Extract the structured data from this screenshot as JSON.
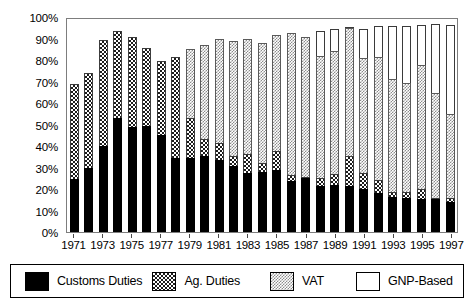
{
  "chart_data": {
    "type": "bar",
    "stacked": true,
    "title": "",
    "xlabel": "",
    "ylabel": "",
    "ylim": [
      0,
      100
    ],
    "ytick_labels": [
      "100%",
      "90%",
      "80%",
      "70%",
      "60%",
      "50%",
      "40%",
      "30%",
      "20%",
      "10%",
      "0%"
    ],
    "ytick_values": [
      100,
      90,
      80,
      70,
      60,
      50,
      40,
      30,
      20,
      10,
      0
    ],
    "grid": false,
    "legend_position": "bottom",
    "categories": [
      1971,
      1972,
      1973,
      1974,
      1975,
      1976,
      1977,
      1978,
      1979,
      1980,
      1981,
      1982,
      1983,
      1984,
      1985,
      1986,
      1987,
      1988,
      1989,
      1990,
      1991,
      1992,
      1993,
      1994,
      1995,
      1996,
      1997
    ],
    "xtick_labels": [
      "1971",
      "",
      "1973",
      "",
      "1975",
      "",
      "1977",
      "",
      "1979",
      "",
      "1981",
      "",
      "1983",
      "",
      "1985",
      "",
      "1987",
      "",
      "1989",
      "",
      "1991",
      "",
      "1993",
      "",
      "1995",
      "",
      "1997"
    ],
    "series": [
      {
        "name": "Customs Duties",
        "color": "#000000",
        "pattern": "solid-black",
        "values": [
          24.5,
          30.0,
          40.0,
          53.0,
          49.0,
          49.5,
          45.0,
          34.5,
          34.5,
          35.5,
          33.5,
          30.5,
          27.5,
          28.0,
          29.0,
          23.5,
          25.0,
          21.5,
          22.0,
          21.5,
          20.0,
          18.0,
          16.5,
          16.0,
          15.5,
          15.5,
          14.0
        ]
      },
      {
        "name": "Ag. Duties",
        "color": "#1c1c1c",
        "pattern": "coarse-checker",
        "values": [
          69.0,
          74.0,
          89.5,
          93.5,
          90.5,
          85.5,
          79.5,
          81.5,
          53.0,
          43.5,
          41.5,
          35.5,
          36.5,
          32.0,
          37.5,
          26.5,
          25.5,
          25.0,
          27.0,
          35.5,
          27.5,
          24.0,
          18.5,
          18.5,
          20.0,
          15.5,
          16.0
        ]
      },
      {
        "name": "VAT",
        "color": "#8c8c8c",
        "pattern": "fine-checker",
        "values": [
          0,
          0,
          0,
          0,
          0,
          0,
          0,
          0,
          85.0,
          87.0,
          90.0,
          89.0,
          90.0,
          88.0,
          91.5,
          92.5,
          90.5,
          82.0,
          84.0,
          95.0,
          81.0,
          81.5,
          71.0,
          69.5,
          77.5,
          64.0,
          55.0
        ]
      },
      {
        "name": "GNP-Based",
        "color": "#ffffff",
        "pattern": "empty",
        "values": [
          0,
          0,
          0,
          0,
          0,
          0,
          0,
          0,
          0,
          0,
          0,
          0,
          0,
          0,
          0,
          0,
          0,
          93.5,
          94.5,
          95.0,
          94.5,
          96.0,
          96.0,
          96.0,
          96.5,
          96.5,
          96.5
        ]
      }
    ],
    "legend": [
      {
        "label": "Customs Duties",
        "swatch": "customs"
      },
      {
        "label": "Ag. Duties",
        "swatch": "ag"
      },
      {
        "label": "VAT",
        "swatch": "vat"
      },
      {
        "label": "GNP-Based",
        "swatch": "gnp"
      }
    ]
  }
}
